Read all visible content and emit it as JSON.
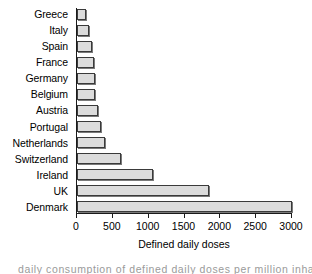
{
  "chart_data": {
    "type": "bar",
    "orientation": "horizontal",
    "title": "",
    "xlabel": "Defined daily doses",
    "ylabel": "",
    "xlim": [
      0,
      3000
    ],
    "xticks": [
      0,
      500,
      1000,
      1500,
      2000,
      2500,
      3000
    ],
    "xticklabels": [
      "0",
      "500",
      "1000",
      "1500",
      "2000",
      "2500",
      "3000"
    ],
    "grid": false,
    "legend": false,
    "categories": [
      "Greece",
      "Italy",
      "Spain",
      "France",
      "Germany",
      "Belgium",
      "Austria",
      "Portugal",
      "Netherlands",
      "Switzerland",
      "Ireland",
      "UK",
      "Denmark"
    ],
    "values": [
      125,
      170,
      210,
      235,
      250,
      255,
      290,
      330,
      390,
      610,
      1060,
      1840,
      3010
    ],
    "bar_fill_color": "#dcdcdc",
    "bar_edge_color": "#3a3a3a",
    "axis_color": "#1a1a1a"
  },
  "caption_sliver": {
    "text": "daily consumption of defined daily doses per million inhabitants"
  }
}
